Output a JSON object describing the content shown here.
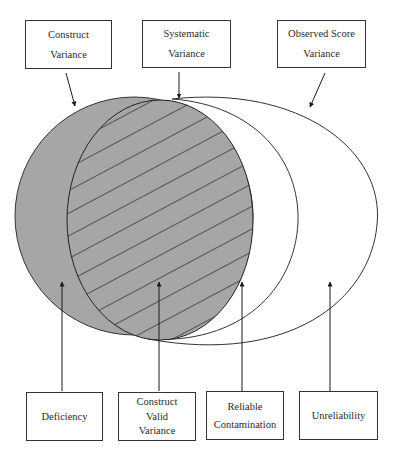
{
  "title_boxes": {
    "construct_variance": {
      "lines": [
        "Construct",
        "Variance"
      ]
    },
    "systematic_variance": {
      "lines": [
        "Systematic",
        "Variance"
      ]
    },
    "observed_score_variance": {
      "lines": [
        "Observed Score",
        "Variance"
      ]
    }
  },
  "region_boxes": {
    "deficiency": {
      "lines": [
        "Deficiency"
      ]
    },
    "construct_valid_variance": {
      "lines": [
        "Construct",
        "Valid",
        "Variance"
      ]
    },
    "reliable_contamination": {
      "lines": [
        "Reliable",
        "Contamination"
      ]
    },
    "unreliability": {
      "lines": [
        "Unreliability"
      ]
    }
  },
  "colors": {
    "construct_fill": "#a6a6a6",
    "hatch_line": "#1a1a1a",
    "outline": "#333333",
    "background": "#ffffff"
  }
}
